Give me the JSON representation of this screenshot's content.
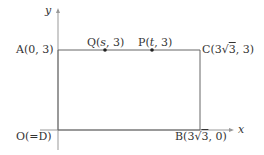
{
  "diagram": {
    "type": "coordinate-plane-rectangle",
    "colors": {
      "line": "#666666",
      "axis": "#999999",
      "text": "#333333",
      "point": "#222222"
    },
    "axes": {
      "x_label": "x",
      "y_label": "y"
    },
    "points": {
      "A": {
        "text": "A(0, 3)"
      },
      "Q": {
        "prefix": "Q(",
        "var": "s",
        "suffix": ", 3)"
      },
      "P": {
        "prefix": "P(",
        "var": "t",
        "suffix": ", 3)"
      },
      "C": {
        "prefix": "C(3",
        "root": "3",
        "suffix": ", 3)"
      },
      "O": {
        "text": "O(=D)"
      },
      "B": {
        "prefix": "B(3",
        "root": "3",
        "suffix": ", 0)"
      }
    }
  }
}
